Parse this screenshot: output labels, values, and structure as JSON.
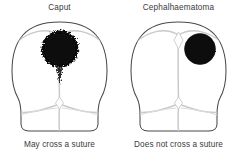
{
  "figure": {
    "name": "caput-succedaneum-vs-cephalhaematoma-diagram",
    "background_color": "#ffffff",
    "outline_color": "#4a4a4a",
    "suture_color": "#c9c9c9",
    "swelling_color": "#0d0d0d",
    "text_color": "#3a3a3a"
  },
  "panels": [
    {
      "id": "caput",
      "title": "Caput",
      "caption": "May cross a suture",
      "skull_view": "vertex",
      "swelling": {
        "name": "caput-swelling",
        "edge": "diffuse",
        "crosses_midline": true,
        "position": "central-anterior",
        "center_x": 60,
        "center_y": 33,
        "radius": 19
      },
      "sutures": [
        "sagittal",
        "coronal",
        "lambdoid",
        "metopic"
      ],
      "fontanelles": [
        "anterior",
        "posterior"
      ]
    },
    {
      "id": "cephalhaematoma",
      "title": "Cephalhaematoma",
      "caption": "Does not cross a suture",
      "skull_view": "vertex",
      "swelling": {
        "name": "cephalhaematoma-swelling",
        "edge": "well-defined",
        "crosses_midline": false,
        "position": "right-parietal",
        "center_x": 81,
        "center_y": 33,
        "radius": 16
      },
      "sutures": [
        "sagittal",
        "coronal",
        "lambdoid",
        "metopic"
      ],
      "fontanelles": [
        "anterior",
        "posterior"
      ]
    }
  ]
}
